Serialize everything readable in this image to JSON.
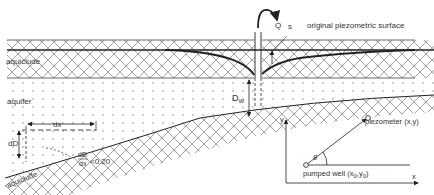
{
  "diagram": {
    "labels": {
      "aquiclude_top": "aquiclude",
      "aquiclude_bottom": "aquiclude",
      "aquifer": "aquifer",
      "discharge": "Q",
      "drawdown": "s",
      "original_surface": "original piezometric surface",
      "well_depth": "D",
      "well_depth_sub": "W",
      "dx": "dx",
      "dD": "dD",
      "slope_num": "dD",
      "slope_den": "dx",
      "slope_cond": "<0.20"
    },
    "inset": {
      "y_axis": "y",
      "x_axis": "x",
      "angle": "θ",
      "piezometer": "piezometer (x,y)",
      "well_prefix": "pumped well (x",
      "well_sub0": "0",
      "well_mid": ",y",
      "well_sub1": "0",
      "well_suffix": ")"
    },
    "colors": {
      "line": "#222222",
      "hatch": "#555555",
      "dots": "#666666",
      "text": "#333333"
    }
  }
}
